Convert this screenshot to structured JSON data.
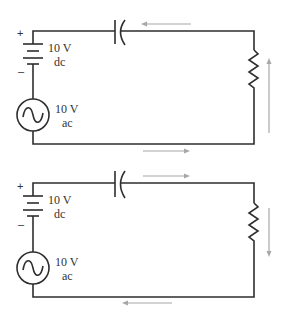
{
  "colors": {
    "wire": "#2e2e2e",
    "arrow": "#a8a8a8",
    "text": "#333333"
  },
  "circuits": [
    {
      "id": "top",
      "battery": {
        "value": "10 V",
        "type": "dc",
        "positive": "+",
        "negative": "–"
      },
      "ac_source": {
        "value": "10 V",
        "type": "ac"
      },
      "current_direction": "counterclockwise",
      "arrows": {
        "top": "left",
        "right": "up",
        "bottom": "right"
      }
    },
    {
      "id": "bottom",
      "battery": {
        "value": "10 V",
        "type": "dc",
        "positive": "+",
        "negative": "–"
      },
      "ac_source": {
        "value": "10 V",
        "type": "ac"
      },
      "current_direction": "clockwise",
      "arrows": {
        "top": "right",
        "right": "down",
        "bottom": "left"
      }
    }
  ]
}
